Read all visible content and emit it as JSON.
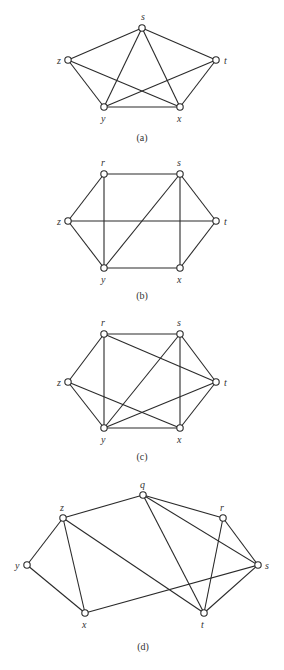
{
  "figures": [
    {
      "caption": "(a)",
      "caption_pos": [
        142,
        141
      ],
      "vertices": [
        {
          "id": "s",
          "x": 142,
          "y": 28,
          "lx": 141,
          "ly": 20
        },
        {
          "id": "z",
          "x": 68,
          "y": 60,
          "lx": 57,
          "ly": 64
        },
        {
          "id": "t",
          "x": 216,
          "y": 60,
          "lx": 224,
          "ly": 64
        },
        {
          "id": "y",
          "x": 104,
          "y": 107,
          "lx": 101,
          "ly": 122
        },
        {
          "id": "x",
          "x": 180,
          "y": 107,
          "lx": 177,
          "ly": 122
        }
      ],
      "edges": [
        [
          "s",
          "z"
        ],
        [
          "s",
          "t"
        ],
        [
          "s",
          "y"
        ],
        [
          "s",
          "x"
        ],
        [
          "z",
          "y"
        ],
        [
          "z",
          "x"
        ],
        [
          "t",
          "y"
        ],
        [
          "t",
          "x"
        ],
        [
          "y",
          "x"
        ]
      ]
    },
    {
      "caption": "(b)",
      "caption_pos": [
        142,
        299
      ],
      "vertices": [
        {
          "id": "r",
          "x": 104,
          "y": 174,
          "lx": 101,
          "ly": 166
        },
        {
          "id": "s",
          "x": 180,
          "y": 174,
          "lx": 177,
          "ly": 166
        },
        {
          "id": "z",
          "x": 68,
          "y": 221,
          "lx": 57,
          "ly": 225
        },
        {
          "id": "t",
          "x": 216,
          "y": 221,
          "lx": 224,
          "ly": 225
        },
        {
          "id": "y",
          "x": 104,
          "y": 268,
          "lx": 101,
          "ly": 283
        },
        {
          "id": "x",
          "x": 180,
          "y": 268,
          "lx": 177,
          "ly": 283
        }
      ],
      "edges": [
        [
          "r",
          "s"
        ],
        [
          "r",
          "z"
        ],
        [
          "r",
          "y"
        ],
        [
          "s",
          "y"
        ],
        [
          "s",
          "x"
        ],
        [
          "s",
          "t"
        ],
        [
          "z",
          "t"
        ],
        [
          "z",
          "y"
        ],
        [
          "y",
          "x"
        ],
        [
          "x",
          "t"
        ]
      ]
    },
    {
      "caption": "(c)",
      "caption_pos": [
        142,
        460
      ],
      "vertices": [
        {
          "id": "r",
          "x": 104,
          "y": 334,
          "lx": 101,
          "ly": 326
        },
        {
          "id": "s",
          "x": 180,
          "y": 334,
          "lx": 177,
          "ly": 326
        },
        {
          "id": "z",
          "x": 68,
          "y": 382,
          "lx": 57,
          "ly": 386
        },
        {
          "id": "t",
          "x": 216,
          "y": 382,
          "lx": 224,
          "ly": 386
        },
        {
          "id": "y",
          "x": 104,
          "y": 428,
          "lx": 101,
          "ly": 443
        },
        {
          "id": "x",
          "x": 180,
          "y": 428,
          "lx": 177,
          "ly": 443
        }
      ],
      "edges": [
        [
          "r",
          "s"
        ],
        [
          "r",
          "z"
        ],
        [
          "r",
          "y"
        ],
        [
          "r",
          "t"
        ],
        [
          "s",
          "y"
        ],
        [
          "s",
          "x"
        ],
        [
          "s",
          "t"
        ],
        [
          "z",
          "y"
        ],
        [
          "z",
          "x"
        ],
        [
          "y",
          "x"
        ],
        [
          "y",
          "t"
        ],
        [
          "x",
          "t"
        ]
      ]
    },
    {
      "caption": "(d)",
      "caption_pos": [
        143,
        650
      ],
      "vertices": [
        {
          "id": "q",
          "x": 143,
          "y": 495,
          "lx": 140,
          "ly": 488
        },
        {
          "id": "z",
          "x": 63,
          "y": 518,
          "lx": 60,
          "ly": 511
        },
        {
          "id": "r",
          "x": 223,
          "y": 518,
          "lx": 220,
          "ly": 511
        },
        {
          "id": "y",
          "x": 27,
          "y": 565,
          "lx": 15,
          "ly": 569
        },
        {
          "id": "s",
          "x": 258,
          "y": 565,
          "lx": 265,
          "ly": 569
        },
        {
          "id": "x",
          "x": 85,
          "y": 613,
          "lx": 82,
          "ly": 628
        },
        {
          "id": "t",
          "x": 204,
          "y": 613,
          "lx": 201,
          "ly": 628
        }
      ],
      "edges": [
        [
          "q",
          "z"
        ],
        [
          "q",
          "r"
        ],
        [
          "q",
          "s"
        ],
        [
          "q",
          "t"
        ],
        [
          "z",
          "y"
        ],
        [
          "z",
          "x"
        ],
        [
          "z",
          "t"
        ],
        [
          "y",
          "x"
        ],
        [
          "x",
          "s"
        ],
        [
          "r",
          "t"
        ],
        [
          "r",
          "s"
        ],
        [
          "s",
          "t"
        ]
      ]
    }
  ]
}
